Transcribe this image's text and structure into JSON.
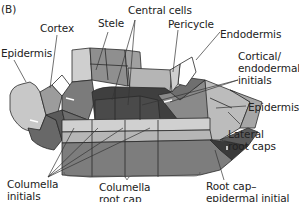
{
  "panel_label": "(B)",
  "labels": {
    "cortex": "Cortex",
    "stele": "Stele",
    "central_cells": "Central cells",
    "pericycle": "Pericycle",
    "endodermis": "Endodermis",
    "epidermis_left": "Epidermis",
    "cortical_line1": "Cortical/",
    "cortical_line2": "endodermal",
    "cortical_line3": "initials",
    "epidermis_right": "Epidermis",
    "lateral_line1": "Lateral",
    "lateral_line2": "root caps",
    "columella_initials_line1": "Columella",
    "columella_initials_line2": "initials",
    "columella_rootcap_line1": "Columella",
    "columella_rootcap_line2": "root cap",
    "rootcap_epi_line1": "Root cap–",
    "rootcap_epi_line2": "epidermal initial"
  },
  "colors": {
    "very_light": "#d4d4d4",
    "light": "#bdbdbd",
    "mid": "#9a9a9a",
    "dark": "#7a7a7a",
    "darker": "#5e5e5e",
    "darkest": "#3f3f3f",
    "outline": "#2a2a2a",
    "leader": "#333333"
  }
}
